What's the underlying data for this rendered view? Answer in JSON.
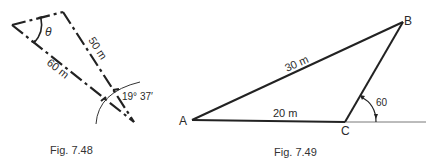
{
  "figures": [
    {
      "caption": "Fig. 7.48",
      "labels": {
        "side_top": "50 m",
        "side_left": "60 m",
        "angle_bottom": "19° 37′",
        "angle_top": "θ"
      }
    },
    {
      "caption": "Fig. 7.49",
      "labels": {
        "side_ab": "30 m",
        "side_ac": "20 m",
        "angle_c": "60",
        "vertex_a": "A",
        "vertex_b": "B",
        "vertex_c": "C"
      }
    }
  ]
}
